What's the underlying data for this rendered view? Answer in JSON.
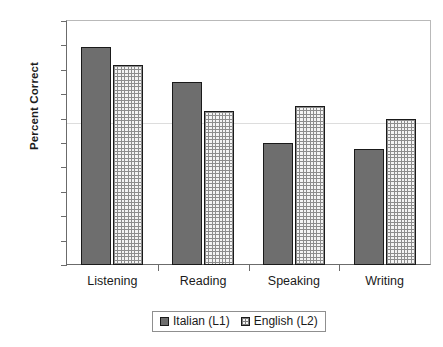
{
  "chart_data": {
    "type": "bar",
    "title": "",
    "xlabel": "",
    "ylabel": "Percent Correct",
    "ylim": [
      0,
      100
    ],
    "ytick_step": 10,
    "yticks": [
      0,
      10,
      20,
      30,
      40,
      50,
      60,
      70,
      80,
      90,
      100
    ],
    "ytick_labels": [
      "0",
      "10",
      "20",
      "30",
      "40",
      "50",
      "60",
      "70",
      "80",
      "90",
      "100"
    ],
    "grid": false,
    "legend_position": "bottom-center",
    "categories": [
      "Listening",
      "Reading",
      "Speaking",
      "Writing"
    ],
    "series": [
      {
        "name": "Italian (L1)",
        "pattern": "solid",
        "color": "#6e6e6e",
        "values": [
          89.5,
          75,
          50,
          47.5
        ]
      },
      {
        "name": "English (L2)",
        "pattern": "crosshatch-grid",
        "color": "#f4f4f4",
        "values": [
          82,
          63,
          65,
          60
        ]
      }
    ]
  },
  "axis": {
    "y_title": "Percent Correct"
  },
  "legend": {
    "entries": [
      "Italian (L1)",
      "English (L2)"
    ]
  }
}
